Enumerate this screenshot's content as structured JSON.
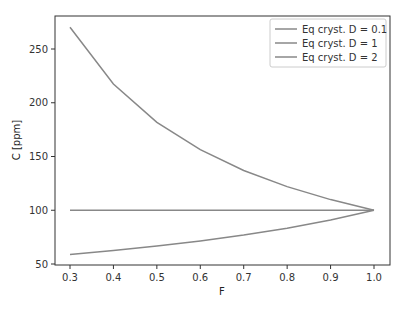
{
  "chart_data": {
    "type": "line",
    "title": "",
    "xlabel": "F",
    "ylabel": "C [ppm]",
    "xlim": [
      0.265,
      1.035
    ],
    "ylim": [
      48,
      280
    ],
    "x": [
      0.3,
      0.4,
      0.5,
      0.6,
      0.7,
      0.8,
      0.9,
      1.0
    ],
    "xticks": [
      0.3,
      0.4,
      0.5,
      0.6,
      0.7,
      0.8,
      0.9,
      1.0
    ],
    "xtick_labels": [
      "0.3",
      "0.4",
      "0.5",
      "0.6",
      "0.7",
      "0.8",
      "0.9",
      "1.0"
    ],
    "yticks": [
      50,
      100,
      150,
      200,
      250
    ],
    "ytick_labels": [
      "50",
      "100",
      "150",
      "200",
      "250"
    ],
    "grid": false,
    "legend_position": "upper right",
    "series": [
      {
        "name": "Eq cryst. D = 0.1",
        "color": "#888888",
        "values": [
          270.3,
          217.4,
          181.8,
          156.3,
          137.0,
          122.0,
          109.9,
          100.0
        ]
      },
      {
        "name": "Eq cryst. D = 1",
        "color": "#888888",
        "values": [
          100,
          100,
          100,
          100,
          100,
          100,
          100,
          100
        ]
      },
      {
        "name": "Eq cryst. D = 2",
        "color": "#888888",
        "values": [
          58.8,
          62.5,
          66.7,
          71.4,
          76.9,
          83.3,
          90.9,
          100.0
        ]
      }
    ]
  }
}
